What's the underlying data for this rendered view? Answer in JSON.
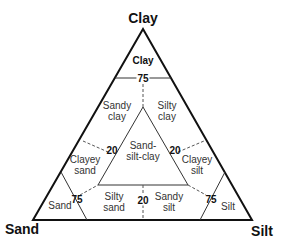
{
  "diagram": {
    "type": "ternary",
    "corners": {
      "top": "Clay",
      "left": "Sand",
      "right": "Silt"
    },
    "regions": [
      {
        "id": "clay",
        "label": "Clay"
      },
      {
        "id": "sandy-clay",
        "label_line1": "Sandy",
        "label_line2": "clay"
      },
      {
        "id": "silty-clay",
        "label_line1": "Silty",
        "label_line2": "clay"
      },
      {
        "id": "sand-silt-clay",
        "label_line1": "Sand-",
        "label_line2": "silt-clay"
      },
      {
        "id": "clayey-sand",
        "label_line1": "Clayey",
        "label_line2": "sand"
      },
      {
        "id": "clayey-silt",
        "label_line1": "Clayey",
        "label_line2": "silt"
      },
      {
        "id": "sand",
        "label": "Sand"
      },
      {
        "id": "silty-sand",
        "label_line1": "Silty",
        "label_line2": "sand"
      },
      {
        "id": "sandy-silt",
        "label_line1": "Sandy",
        "label_line2": "silt"
      },
      {
        "id": "silt",
        "label": "Silt"
      }
    ],
    "thresholds": {
      "clay_75": "75",
      "left_20": "20",
      "right_20": "20",
      "bottom_20": "20",
      "sand_75": "75",
      "silt_75": "75"
    }
  }
}
